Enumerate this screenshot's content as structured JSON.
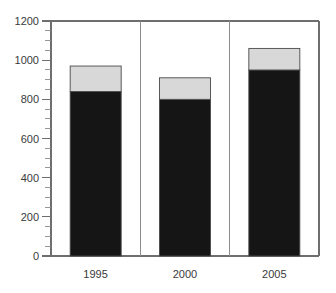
{
  "chart_data": {
    "type": "bar",
    "title": "",
    "subtitle": "",
    "xlabel": "",
    "ylabel": "",
    "categories": [
      "1995",
      "2000",
      "2005"
    ],
    "series": [
      {
        "name": "lower-segment",
        "color": "#151515",
        "values": [
          840,
          800,
          950
        ]
      },
      {
        "name": "upper-segment",
        "color": "#d8d8d8",
        "values": [
          130,
          110,
          110
        ]
      }
    ],
    "totals": [
      970,
      910,
      1060
    ],
    "stacked": true,
    "ylim": [
      0,
      1200
    ],
    "ytick_values": [
      0,
      200,
      400,
      600,
      800,
      1000,
      1200
    ],
    "ytick_labels": [
      "0",
      "200",
      "400",
      "600",
      "800",
      "1000",
      "1200"
    ],
    "yminor_step": 50,
    "grid": false,
    "legend": "none",
    "panel_separators": true,
    "annotations": []
  },
  "axes": {
    "y_ticks": [
      {
        "label": "1200",
        "value": 1200
      },
      {
        "label": "1000",
        "value": 1000
      },
      {
        "label": "800",
        "value": 800
      },
      {
        "label": "600",
        "value": 600
      },
      {
        "label": "400",
        "value": 400
      },
      {
        "label": "200",
        "value": 200
      },
      {
        "label": "0",
        "value": 0
      }
    ],
    "x_ticks": [
      {
        "label": "1995"
      },
      {
        "label": "2000"
      },
      {
        "label": "2005"
      }
    ]
  },
  "colors": {
    "dark_fill": "#151515",
    "light_fill": "#d8d8d8",
    "bar_outline": "#4a4a4a",
    "axis": "#6e6e6e",
    "text": "#3a3a3a",
    "background": "#ffffff"
  }
}
